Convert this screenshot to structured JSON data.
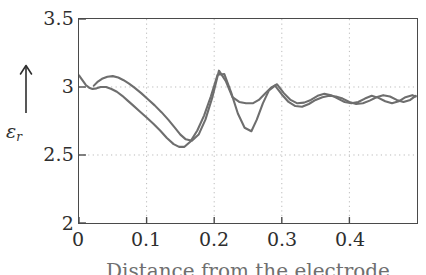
{
  "chart_data": {
    "type": "line",
    "title": "",
    "xlabel": "Distance from the electrode",
    "ylabel": "εᵣ",
    "ylabel_symbol": "ε",
    "ylabel_subscript": "r",
    "ylabel_arrow": "↑",
    "xlim": [
      0,
      0.5
    ],
    "ylim": [
      2,
      3.5
    ],
    "xticks": [
      0,
      0.1,
      0.2,
      0.3,
      0.4
    ],
    "xtick_labels": [
      "0",
      "0.1",
      "0.2",
      "0.3",
      "0.4"
    ],
    "yticks": [
      2,
      2.5,
      3,
      3.5
    ],
    "ytick_labels": [
      "2",
      "2.5",
      "3",
      "3.5"
    ],
    "grid": "dotted",
    "grid_color": "#b9b9b9",
    "frame_color": "#4a4a4a",
    "legend": "none",
    "series": [
      {
        "name": "curve-1",
        "color": "#6e6e6e",
        "x": [
          0.0,
          0.005,
          0.01,
          0.015,
          0.02,
          0.026,
          0.032,
          0.04,
          0.048,
          0.056,
          0.064,
          0.072,
          0.08,
          0.09,
          0.1,
          0.11,
          0.12,
          0.13,
          0.14,
          0.148,
          0.156,
          0.165,
          0.175,
          0.185,
          0.195,
          0.205,
          0.215,
          0.225,
          0.235,
          0.245,
          0.255,
          0.263,
          0.272,
          0.281,
          0.29,
          0.3,
          0.31,
          0.32,
          0.33,
          0.34,
          0.35,
          0.36,
          0.37,
          0.38,
          0.39,
          0.4,
          0.41,
          0.42,
          0.43,
          0.44,
          0.45,
          0.46,
          0.47,
          0.48,
          0.49,
          0.498
        ],
        "y": [
          3.085,
          3.05,
          3.015,
          2.995,
          2.985,
          2.99,
          3.0,
          3.0,
          2.985,
          2.965,
          2.935,
          2.9,
          2.865,
          2.82,
          2.775,
          2.73,
          2.68,
          2.625,
          2.58,
          2.56,
          2.56,
          2.6,
          2.68,
          2.79,
          2.93,
          3.09,
          3.095,
          2.96,
          2.805,
          2.7,
          2.675,
          2.76,
          2.88,
          2.975,
          3.01,
          2.945,
          2.89,
          2.86,
          2.855,
          2.875,
          2.905,
          2.925,
          2.935,
          2.93,
          2.915,
          2.89,
          2.875,
          2.88,
          2.9,
          2.925,
          2.94,
          2.93,
          2.905,
          2.89,
          2.905,
          2.935
        ]
      },
      {
        "name": "curve-2",
        "color": "#6e6e6e",
        "x": [
          0.022,
          0.028,
          0.034,
          0.042,
          0.05,
          0.058,
          0.066,
          0.074,
          0.082,
          0.092,
          0.102,
          0.112,
          0.122,
          0.132,
          0.142,
          0.15,
          0.158,
          0.167,
          0.177,
          0.187,
          0.197,
          0.207,
          0.217,
          0.227,
          0.237,
          0.247,
          0.257,
          0.266,
          0.275,
          0.284,
          0.293,
          0.303,
          0.313,
          0.323,
          0.333,
          0.343,
          0.353,
          0.363,
          0.373,
          0.383,
          0.393,
          0.403,
          0.413,
          0.423,
          0.433,
          0.443,
          0.453,
          0.463,
          0.473,
          0.483,
          0.493,
          0.498
        ],
        "y": [
          3.01,
          3.04,
          3.06,
          3.075,
          3.08,
          3.07,
          3.05,
          3.025,
          2.995,
          2.955,
          2.91,
          2.865,
          2.815,
          2.76,
          2.7,
          2.65,
          2.615,
          2.605,
          2.65,
          2.76,
          2.92,
          3.12,
          3.045,
          2.925,
          2.89,
          2.88,
          2.88,
          2.905,
          2.95,
          2.995,
          3.02,
          2.955,
          2.905,
          2.88,
          2.885,
          2.905,
          2.935,
          2.95,
          2.94,
          2.915,
          2.89,
          2.88,
          2.89,
          2.915,
          2.935,
          2.92,
          2.895,
          2.88,
          2.895,
          2.925,
          2.94,
          2.93
        ]
      }
    ]
  }
}
